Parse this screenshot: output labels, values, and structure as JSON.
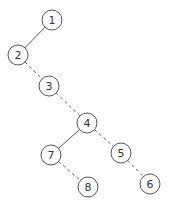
{
  "diagram": {
    "type": "binary-tree",
    "node_radius": 10,
    "colors": {
      "stroke": "#555555",
      "text": "#333333",
      "background": "#ffffff"
    },
    "nodes": [
      {
        "id": "1",
        "label": "1",
        "x": 52,
        "y": 20
      },
      {
        "id": "2",
        "label": "2",
        "x": 18,
        "y": 55
      },
      {
        "id": "3",
        "label": "3",
        "x": 49,
        "y": 86
      },
      {
        "id": "4",
        "label": "4",
        "x": 87,
        "y": 123
      },
      {
        "id": "7",
        "label": "7",
        "x": 51,
        "y": 155
      },
      {
        "id": "5",
        "label": "5",
        "x": 121,
        "y": 153
      },
      {
        "id": "8",
        "label": "8",
        "x": 88,
        "y": 187
      },
      {
        "id": "6",
        "label": "6",
        "x": 150,
        "y": 184
      }
    ],
    "edges": [
      {
        "from": "1",
        "to": "2",
        "style": "solid"
      },
      {
        "from": "2",
        "to": "3",
        "style": "dashed"
      },
      {
        "from": "3",
        "to": "4",
        "style": "dashed"
      },
      {
        "from": "4",
        "to": "7",
        "style": "solid"
      },
      {
        "from": "4",
        "to": "5",
        "style": "dashed"
      },
      {
        "from": "7",
        "to": "8",
        "style": "dashed"
      },
      {
        "from": "5",
        "to": "6",
        "style": "dashed"
      }
    ]
  }
}
